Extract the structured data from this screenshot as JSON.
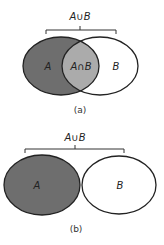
{
  "figures": [
    {
      "id": "a",
      "caption": "(a)",
      "union_label": "A∪B",
      "set_a_label": "A",
      "set_b_label": "B",
      "intersection_label": "A∩B",
      "relationship": "overlapping"
    },
    {
      "id": "b",
      "caption": "(b)",
      "union_label": "A∪B",
      "set_a_label": "A",
      "set_b_label": "B",
      "relationship": "disjoint"
    }
  ],
  "colors": {
    "set_a_fill": "#6e6e6e",
    "intersection_fill": "#ababab",
    "set_b_fill": "#ffffff",
    "outline": "#222222",
    "background": "#ffffff"
  }
}
